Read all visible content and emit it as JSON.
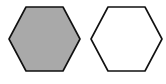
{
  "diagram": {
    "shapes": [
      {
        "name": "hexagon-filled",
        "type": "hexagon",
        "fill": "#a9a9a9",
        "stroke": "#111111"
      },
      {
        "name": "hexagon-empty",
        "type": "hexagon",
        "fill": "#ffffff",
        "stroke": "#111111"
      }
    ]
  }
}
